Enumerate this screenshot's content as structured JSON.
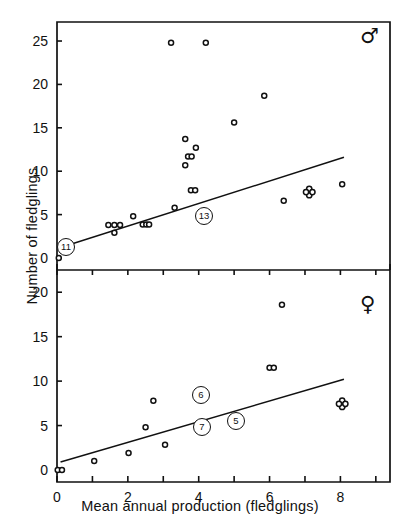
{
  "figure": {
    "xlabel": "Mean annual production (fledglings)",
    "ylabel": "Number of fledglings",
    "male_symbol": "♂",
    "female_symbol": "♀"
  },
  "chart_data": [
    {
      "type": "scatter",
      "panel": "top",
      "title": "",
      "sex": "male",
      "sex_symbol": "♂",
      "xlabel": "Mean annual production (fledglings)",
      "ylabel": "Number of fledglings",
      "xlim": [
        0,
        9.4
      ],
      "ylim": [
        0,
        26.5
      ],
      "xticks": [
        0,
        1,
        2,
        3,
        4,
        5,
        6,
        7,
        8,
        9
      ],
      "xticklabels": [
        "0",
        "",
        "2",
        "",
        "4",
        "",
        "6",
        "",
        "8",
        ""
      ],
      "yticks": [
        0,
        5,
        10,
        15,
        20,
        25
      ],
      "yticklabels": [
        "0",
        "5",
        "10",
        "15",
        "20",
        "25"
      ],
      "grid": false,
      "legend": "none",
      "points": [
        {
          "x": 0.05,
          "y": 0.0
        },
        {
          "x": 1.45,
          "y": 3.8
        },
        {
          "x": 1.62,
          "y": 3.8
        },
        {
          "x": 1.78,
          "y": 3.8
        },
        {
          "x": 1.62,
          "y": 2.9
        },
        {
          "x": 2.15,
          "y": 4.8
        },
        {
          "x": 2.42,
          "y": 3.85
        },
        {
          "x": 2.52,
          "y": 3.85
        },
        {
          "x": 2.6,
          "y": 3.85
        },
        {
          "x": 3.22,
          "y": 24.8
        },
        {
          "x": 3.32,
          "y": 5.8
        },
        {
          "x": 3.62,
          "y": 10.7
        },
        {
          "x": 3.62,
          "y": 13.7
        },
        {
          "x": 3.7,
          "y": 11.7
        },
        {
          "x": 3.8,
          "y": 11.7
        },
        {
          "x": 3.78,
          "y": 7.8
        },
        {
          "x": 3.9,
          "y": 7.8
        },
        {
          "x": 3.92,
          "y": 12.7
        },
        {
          "x": 4.2,
          "y": 24.8
        },
        {
          "x": 5.0,
          "y": 15.6
        },
        {
          "x": 5.85,
          "y": 18.7
        },
        {
          "x": 6.4,
          "y": 6.6
        },
        {
          "x": 7.05,
          "y": 7.6
        },
        {
          "x": 7.18,
          "y": 7.6
        },
        {
          "x": 8.05,
          "y": 8.5
        }
      ],
      "overlap_marker": {
        "x": 7.12,
        "y": 7.6,
        "style": "cross-cluster"
      },
      "regression_line": {
        "x1": 0.1,
        "y1": 1.2,
        "x2": 8.1,
        "y2": 11.6
      },
      "annotations": [
        {
          "label": "11",
          "x": 0.05,
          "y": 0.0,
          "style": "circled",
          "px": 66,
          "py": 247
        },
        {
          "label": "13",
          "x": 3.95,
          "y": 3.7,
          "style": "circled",
          "px": 204,
          "py": 216
        }
      ]
    },
    {
      "type": "scatter",
      "panel": "bottom",
      "title": "",
      "sex": "female",
      "sex_symbol": "♀",
      "xlabel": "Mean annual production (fledglings)",
      "ylabel": "Number of fledglings",
      "xlim": [
        0,
        9.4
      ],
      "ylim": [
        0,
        22.5
      ],
      "xticks": [
        0,
        1,
        2,
        3,
        4,
        5,
        6,
        7,
        8,
        9
      ],
      "xticklabels": [
        "0",
        "",
        "2",
        "",
        "4",
        "",
        "6",
        "",
        "8",
        ""
      ],
      "yticks": [
        0,
        5,
        10,
        15,
        20
      ],
      "yticklabels": [
        "0",
        "5",
        "10",
        "15",
        "20"
      ],
      "grid": false,
      "legend": "none",
      "points": [
        {
          "x": 0.02,
          "y": 0.0
        },
        {
          "x": 0.14,
          "y": 0.0
        },
        {
          "x": 1.05,
          "y": 1.0
        },
        {
          "x": 2.02,
          "y": 1.9
        },
        {
          "x": 2.5,
          "y": 4.8
        },
        {
          "x": 2.72,
          "y": 7.8
        },
        {
          "x": 3.05,
          "y": 2.85
        },
        {
          "x": 6.0,
          "y": 11.5
        },
        {
          "x": 6.12,
          "y": 11.5
        },
        {
          "x": 6.35,
          "y": 18.6
        },
        {
          "x": 8.0,
          "y": 7.4
        },
        {
          "x": 8.12,
          "y": 7.4
        }
      ],
      "overlap_marker": {
        "x": 8.05,
        "y": 7.45,
        "style": "cross-cluster"
      },
      "regression_line": {
        "x1": 0.1,
        "y1": 0.9,
        "x2": 8.1,
        "y2": 10.2
      },
      "annotations": [
        {
          "label": "6",
          "x": 4.0,
          "y": 7.8,
          "style": "circled",
          "px": 201,
          "py": 395
        },
        {
          "label": "7",
          "x": 4.05,
          "y": 3.7,
          "style": "circled",
          "px": 202,
          "py": 427
        },
        {
          "label": "5",
          "x": 5.0,
          "y": 4.7,
          "style": "circled",
          "px": 236,
          "py": 421
        }
      ]
    }
  ]
}
